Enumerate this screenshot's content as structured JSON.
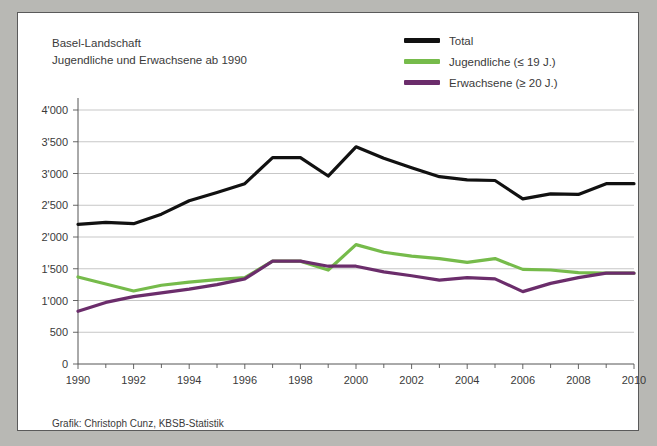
{
  "figure": {
    "title_lines": [
      "Basel-Landschaft",
      "Jugendliche und Erwachsene ab 1990"
    ],
    "credit": "Grafik: Christoph Cunz, KBSB-Statistik",
    "panel_background": "#ffffff",
    "page_background": "#b8b8b4",
    "border_color": "#5a5a5a"
  },
  "legend": {
    "position": "top-right",
    "entries": [
      {
        "label": "Total",
        "color": "#111111"
      },
      {
        "label": "Jugendliche (≤ 19 J.)",
        "color": "#76bb4b"
      },
      {
        "label": "Erwachsene (≥ 20 J.)",
        "color": "#6b2d6b"
      }
    ]
  },
  "axes": {
    "y_ticks": [
      "0",
      "500",
      "1'000",
      "1'500",
      "2'000",
      "2'500",
      "3'000",
      "3'500",
      "4'000"
    ],
    "x_ticks": [
      "1990",
      "1992",
      "1994",
      "1996",
      "1998",
      "2000",
      "2002",
      "2004",
      "2006",
      "2008",
      "2010"
    ]
  },
  "chart_data": {
    "type": "line",
    "xlabel": "",
    "ylabel": "",
    "xlim": [
      1990,
      2010
    ],
    "ylim": [
      0,
      4000
    ],
    "grid": "horizontal",
    "legend_position": "top-right",
    "x": [
      1990,
      1991,
      1992,
      1993,
      1994,
      1995,
      1996,
      1997,
      1998,
      1999,
      2000,
      2001,
      2002,
      2003,
      2004,
      2005,
      2006,
      2007,
      2008,
      2009,
      2010
    ],
    "series": [
      {
        "name": "Total",
        "color": "#111111",
        "values": [
          2200,
          2230,
          2210,
          2360,
          2570,
          2700,
          2840,
          3250,
          3250,
          2960,
          3420,
          3240,
          3090,
          2950,
          2900,
          2890,
          2600,
          2680,
          2670,
          2840,
          2840
        ]
      },
      {
        "name": "Jugendliche (≤ 19 J.)",
        "color": "#76bb4b",
        "values": [
          1370,
          1260,
          1150,
          1240,
          1290,
          1330,
          1360,
          1620,
          1620,
          1480,
          1880,
          1760,
          1700,
          1660,
          1600,
          1660,
          1490,
          1480,
          1440,
          1430,
          1430
        ]
      },
      {
        "name": "Erwachsene (≥ 20 J.)",
        "color": "#6b2d6b",
        "values": [
          830,
          970,
          1060,
          1120,
          1180,
          1250,
          1340,
          1620,
          1620,
          1540,
          1540,
          1450,
          1390,
          1320,
          1360,
          1340,
          1140,
          1270,
          1360,
          1430,
          1430
        ]
      }
    ]
  }
}
